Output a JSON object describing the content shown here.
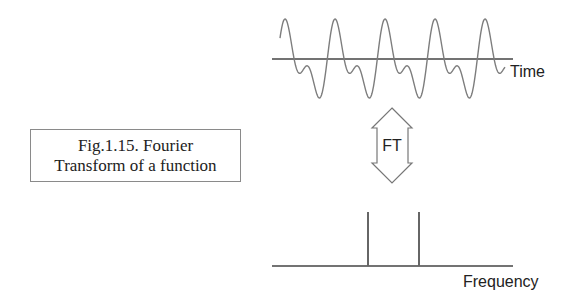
{
  "caption": {
    "line1": "Fig.1.15. Fourier",
    "line2": "Transform of a function"
  },
  "time_domain": {
    "axis_label": "Time",
    "signal": "periodic waveform with fundamental and harmonic (tall peak, small bump, deep trough per period)",
    "periods_visible": 5
  },
  "transform": {
    "label": "FT",
    "icon": "double-headed-arrow-icon"
  },
  "frequency_domain": {
    "axis_label": "Frequency",
    "spikes": 2
  },
  "colors": {
    "stroke": "#555555",
    "wave": "#7a7a7a",
    "text": "#222222",
    "background": "#ffffff"
  }
}
